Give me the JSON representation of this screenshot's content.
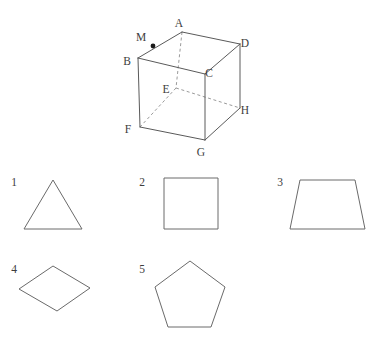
{
  "page": {
    "background_color": "#ffffff",
    "line_color": "#5a5a5a",
    "hidden_line_color": "#8e8e8e",
    "label_color": "#3d3d3d",
    "clipped_top_text": "· · · · · · ·"
  },
  "figure": {
    "name": "cube-with-point-m",
    "type": "cube",
    "vertices": [
      {
        "id": "A",
        "label": "A",
        "x": 182,
        "y": 32,
        "label_x": 179,
        "label_y": 24,
        "hidden": false
      },
      {
        "id": "B",
        "label": "B",
        "x": 138,
        "y": 58,
        "label_x": 127,
        "label_y": 62,
        "hidden": false
      },
      {
        "id": "C",
        "label": "C",
        "x": 205,
        "y": 74,
        "label_x": 209,
        "label_y": 74,
        "hidden": false
      },
      {
        "id": "D",
        "label": "D",
        "x": 240,
        "y": 44,
        "label_x": 245,
        "label_y": 44,
        "hidden": false
      },
      {
        "id": "E",
        "label": "E",
        "x": 176,
        "y": 88,
        "label_x": 166,
        "label_y": 90,
        "hidden": true
      },
      {
        "id": "F",
        "label": "F",
        "x": 140,
        "y": 127,
        "label_x": 128,
        "label_y": 130,
        "hidden": false
      },
      {
        "id": "G",
        "label": "G",
        "x": 205,
        "y": 140,
        "label_x": 201,
        "label_y": 153,
        "hidden": false
      },
      {
        "id": "H",
        "label": "H",
        "x": 240,
        "y": 108,
        "label_x": 245,
        "label_y": 111,
        "hidden": false
      }
    ],
    "marked_point": {
      "id": "M",
      "label": "M",
      "x": 153,
      "y": 46,
      "label_x": 141,
      "label_y": 38,
      "on_edge": "B-A"
    },
    "solid_edges": [
      [
        "B",
        "A"
      ],
      [
        "A",
        "D"
      ],
      [
        "D",
        "H"
      ],
      [
        "B",
        "C"
      ],
      [
        "C",
        "D"
      ],
      [
        "B",
        "F"
      ],
      [
        "F",
        "G"
      ],
      [
        "G",
        "H"
      ],
      [
        "C",
        "G"
      ]
    ],
    "hidden_edges": [
      [
        "A",
        "E"
      ],
      [
        "E",
        "F"
      ],
      [
        "E",
        "H"
      ]
    ]
  },
  "options": [
    {
      "number": "1",
      "name": "triangle",
      "num_x": 14,
      "num_y": 183,
      "points": "53,180 82,229 24,229"
    },
    {
      "number": "2",
      "name": "square",
      "num_x": 142,
      "num_y": 183,
      "points": "164,178 218,178 218,229 164,229"
    },
    {
      "number": "3",
      "name": "trapezoid",
      "num_x": 280,
      "num_y": 183,
      "points": "300,180 355,180 365,229 290,229"
    },
    {
      "number": "4",
      "name": "rhombus",
      "num_x": 14,
      "num_y": 270,
      "points": "53,266 90,288 57,311 19,289"
    },
    {
      "number": "5",
      "name": "pentagon",
      "num_x": 142,
      "num_y": 270,
      "points": "190,261 225,287 211,327 168,327 155,287"
    }
  ]
}
